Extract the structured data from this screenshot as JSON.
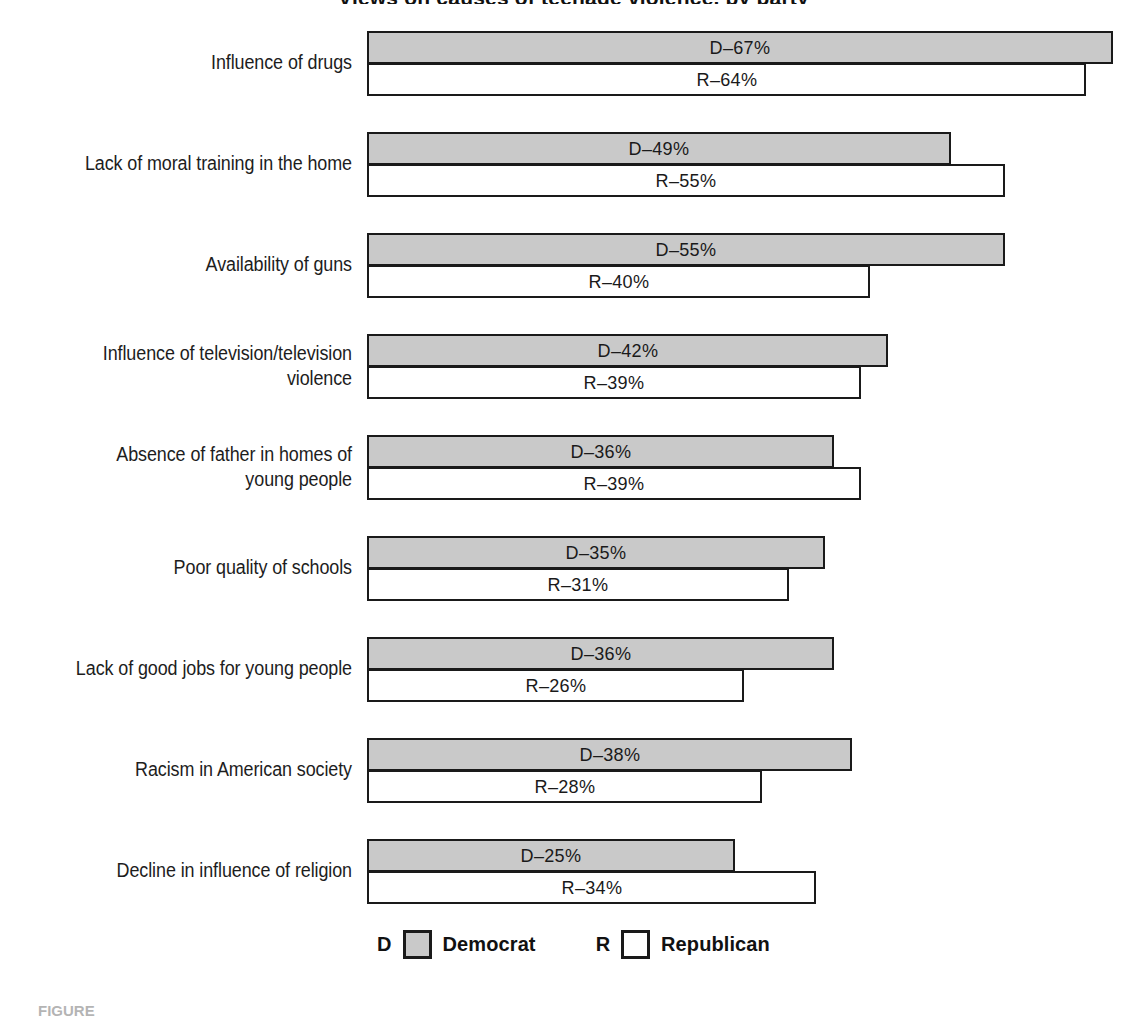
{
  "title": "Views on causes of teenage violence, by party",
  "caption": "FIGURE",
  "legend": {
    "items": [
      {
        "key": "D",
        "label": "Democrat",
        "swatch": "dem",
        "color": "#c9c9c9"
      },
      {
        "key": "R",
        "label": "Republican",
        "swatch": "rep",
        "color": "#ffffff"
      }
    ]
  },
  "chart_data": {
    "type": "bar",
    "orientation": "horizontal",
    "title": "Views on causes of teenage violence, by party",
    "xlabel": "",
    "ylabel": "",
    "grid": false,
    "legend_position": "bottom-center",
    "value_suffix": "%",
    "categories": [
      "Influence of drugs",
      "Lack of moral training in the home",
      "Availability of guns",
      "Influence of television/television violence",
      "Absence of father in homes of young people",
      "Poor quality of schools",
      "Lack of good jobs for young people",
      "Racism in American society",
      "Decline in influence of religion"
    ],
    "series": [
      {
        "name": "Democrat",
        "key": "D",
        "values": [
          67,
          49,
          55,
          42,
          36,
          35,
          36,
          38,
          25
        ]
      },
      {
        "name": "Republican",
        "key": "R",
        "values": [
          64,
          55,
          40,
          39,
          39,
          31,
          26,
          28,
          34
        ]
      }
    ],
    "ylim": [
      0,
      70
    ]
  },
  "rows": [
    {
      "label_lines": [
        "Influence of drugs"
      ],
      "dem": {
        "label": "D–67%",
        "value": 67
      },
      "rep": {
        "label": "R–64%",
        "value": 64
      }
    },
    {
      "label_lines": [
        "Lack of moral training in the home"
      ],
      "dem": {
        "label": "D–49%",
        "value": 49
      },
      "rep": {
        "label": "R–55%",
        "value": 55
      }
    },
    {
      "label_lines": [
        "Availability of guns"
      ],
      "dem": {
        "label": "D–55%",
        "value": 55
      },
      "rep": {
        "label": "R–40%",
        "value": 40
      }
    },
    {
      "label_lines": [
        "Influence of television/television",
        "violence"
      ],
      "dem": {
        "label": "D–42%",
        "value": 42
      },
      "rep": {
        "label": "R–39%",
        "value": 39
      }
    },
    {
      "label_lines": [
        "Absence of father in homes of",
        "young people"
      ],
      "dem": {
        "label": "D–36%",
        "value": 36
      },
      "rep": {
        "label": "R–39%",
        "value": 39
      }
    },
    {
      "label_lines": [
        "Poor quality of schools"
      ],
      "dem": {
        "label": "D–35%",
        "value": 35
      },
      "rep": {
        "label": "R–31%",
        "value": 31
      }
    },
    {
      "label_lines": [
        "Lack of good jobs for young people"
      ],
      "dem": {
        "label": "D–36%",
        "value": 36
      },
      "rep": {
        "label": "R–26%",
        "value": 26
      }
    },
    {
      "label_lines": [
        "Racism in American society"
      ],
      "dem": {
        "label": "D–38%",
        "value": 38
      },
      "rep": {
        "label": "R–28%",
        "value": 28
      }
    },
    {
      "label_lines": [
        "Decline in influence of religion"
      ],
      "dem": {
        "label": "D–25%",
        "value": 25
      },
      "rep": {
        "label": "R–34%",
        "value": 34
      }
    }
  ],
  "geometry": {
    "bar_origin_x": 367,
    "axis_zero_x": 510,
    "px_per_percent": 9,
    "row_top_first": 31,
    "row_pitch": 101
  }
}
